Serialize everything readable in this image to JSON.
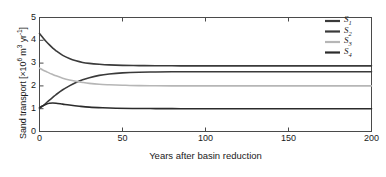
{
  "chart_data": {
    "type": "line",
    "title": "",
    "xlabel": "Years after basin reduction",
    "ylabel": "Sand transport [×10⁶ m³ yr⁻¹]",
    "ylabel_parts": {
      "prefix": "Sand transport [×10",
      "exp1": "6",
      "mid": " m",
      "exp2": "3",
      "mid2": " yr",
      "exp3": "-1",
      "suffix": "]"
    },
    "xlim": [
      0,
      200
    ],
    "ylim": [
      0,
      5
    ],
    "xticks": [
      0,
      50,
      100,
      150,
      200
    ],
    "yticks": [
      0,
      1,
      2,
      3,
      4,
      5
    ],
    "xticklabels": [
      "0",
      "50",
      "100",
      "150",
      "200"
    ],
    "yticklabels": [
      "0",
      "1",
      "2",
      "3",
      "4",
      "5"
    ],
    "grid": false,
    "legend_position": "upper-right",
    "series": [
      {
        "name": "S1",
        "label": "S",
        "sub": "1",
        "color": "#3a3a3a",
        "start_value": 4.3,
        "end_value": 2.88,
        "description": "decays from 4.3 to asymptote 2.88",
        "x": [
          0,
          2,
          4,
          6,
          8,
          10,
          14,
          18,
          22,
          26,
          30,
          36,
          42,
          50,
          60,
          70,
          85,
          100,
          130,
          160,
          200
        ],
        "y": [
          4.3,
          4.12,
          3.95,
          3.8,
          3.66,
          3.54,
          3.34,
          3.2,
          3.1,
          3.03,
          2.99,
          2.95,
          2.92,
          2.9,
          2.89,
          2.885,
          2.88,
          2.88,
          2.88,
          2.88,
          2.88
        ]
      },
      {
        "name": "S2",
        "label": "S",
        "sub": "2",
        "color": "#3a3a3a",
        "start_value": 1.0,
        "end_value": 2.62,
        "description": "rises from 1.0 to asymptote 2.62",
        "x": [
          0,
          2,
          4,
          6,
          8,
          10,
          14,
          18,
          22,
          26,
          30,
          36,
          42,
          50,
          60,
          70,
          85,
          100,
          130,
          160,
          200
        ],
        "y": [
          1.0,
          1.12,
          1.25,
          1.38,
          1.5,
          1.62,
          1.83,
          2.0,
          2.15,
          2.27,
          2.36,
          2.46,
          2.52,
          2.57,
          2.6,
          2.61,
          2.62,
          2.62,
          2.62,
          2.62,
          2.62
        ]
      },
      {
        "name": "S3",
        "label": "S",
        "sub": "3",
        "color": "#b6b6b6",
        "start_value": 2.78,
        "end_value": 2.0,
        "description": "decays from 2.78 to asymptote 2.0",
        "x": [
          0,
          2,
          4,
          6,
          8,
          10,
          14,
          18,
          22,
          26,
          30,
          36,
          42,
          50,
          60,
          70,
          85,
          100,
          130,
          160,
          200
        ],
        "y": [
          2.78,
          2.7,
          2.63,
          2.56,
          2.5,
          2.44,
          2.34,
          2.26,
          2.2,
          2.15,
          2.11,
          2.07,
          2.05,
          2.03,
          2.01,
          2.005,
          2.0,
          2.0,
          2.0,
          2.0,
          2.0
        ]
      },
      {
        "name": "S4",
        "label": "S",
        "sub": "4",
        "color": "#2b2b2b",
        "start_value": 1.05,
        "end_value": 1.0,
        "description": "small early bump to 1.25 near year 8, settles at 1.0",
        "x": [
          0,
          2,
          4,
          6,
          8,
          10,
          14,
          18,
          24,
          30,
          38,
          46,
          56,
          70,
          85,
          100,
          130,
          160,
          200
        ],
        "y": [
          1.05,
          1.13,
          1.2,
          1.24,
          1.25,
          1.24,
          1.2,
          1.16,
          1.11,
          1.07,
          1.04,
          1.02,
          1.01,
          1.005,
          1.0,
          1.0,
          1.0,
          1.0,
          1.0
        ]
      }
    ]
  },
  "legend": {
    "entries": [
      {
        "label": "S",
        "sub": "1",
        "color": "#3a3a3a"
      },
      {
        "label": "S",
        "sub": "2",
        "color": "#3a3a3a"
      },
      {
        "label": "S",
        "sub": "3",
        "color": "#b6b6b6"
      },
      {
        "label": "S",
        "sub": "4",
        "color": "#2b2b2b"
      }
    ]
  },
  "axes": {
    "frame_color": "#4a4a4a"
  }
}
